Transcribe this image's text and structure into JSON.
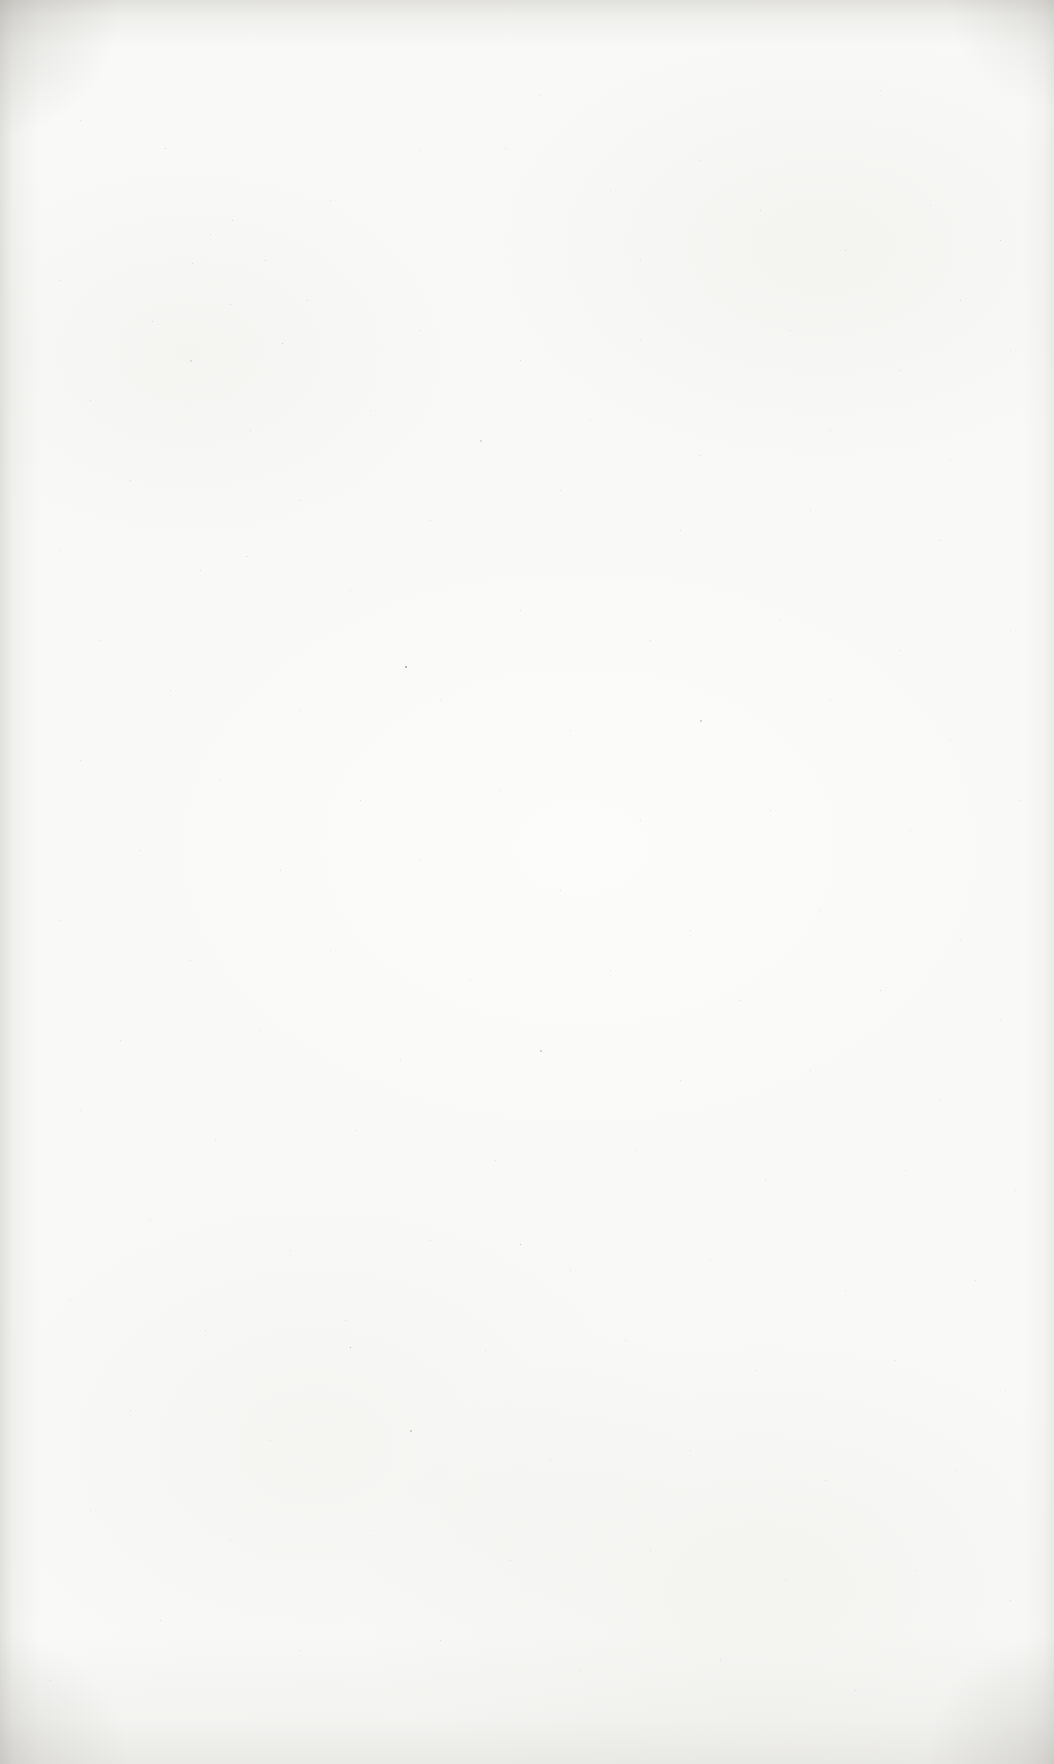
{
  "page": {
    "paper_color": "#f9f9f7",
    "edge_shadow_color": "#adaba4",
    "speck_color": "#55534e",
    "specks": [
      [
        165,
        148,
        1,
        0.3
      ],
      [
        232,
        220,
        1,
        0.25
      ],
      [
        210,
        234,
        1,
        0.22
      ],
      [
        265,
        260,
        1,
        0.28
      ],
      [
        192,
        263,
        1,
        0.2
      ],
      [
        330,
        200,
        1,
        0.18
      ],
      [
        420,
        150,
        1,
        0.2
      ],
      [
        505,
        148,
        1,
        0.25
      ],
      [
        610,
        190,
        1,
        0.18
      ],
      [
        700,
        160,
        1,
        0.2
      ],
      [
        760,
        210,
        1,
        0.22
      ],
      [
        845,
        250,
        1,
        0.25
      ],
      [
        930,
        205,
        1,
        0.2
      ],
      [
        1000,
        240,
        1,
        0.22
      ],
      [
        80,
        120,
        1,
        0.18
      ],
      [
        540,
        95,
        1,
        0.15
      ],
      [
        880,
        90,
        1,
        0.18
      ],
      [
        640,
        260,
        1,
        0.2
      ],
      [
        960,
        300,
        1,
        0.22
      ],
      [
        60,
        280,
        1,
        0.2
      ],
      [
        230,
        304,
        1,
        0.28
      ],
      [
        307,
        300,
        1,
        0.3
      ],
      [
        152,
        321,
        1,
        0.25
      ],
      [
        282,
        343,
        1,
        0.3
      ],
      [
        190,
        360,
        2,
        0.2
      ],
      [
        420,
        330,
        1,
        0.2
      ],
      [
        520,
        360,
        1,
        0.22
      ],
      [
        640,
        340,
        1,
        0.18
      ],
      [
        790,
        330,
        1,
        0.2
      ],
      [
        900,
        370,
        1,
        0.22
      ],
      [
        1010,
        350,
        1,
        0.18
      ],
      [
        90,
        400,
        1,
        0.2
      ],
      [
        250,
        430,
        1,
        0.22
      ],
      [
        370,
        410,
        1,
        0.18
      ],
      [
        480,
        440,
        2,
        0.25
      ],
      [
        590,
        420,
        1,
        0.2
      ],
      [
        700,
        455,
        1,
        0.22
      ],
      [
        830,
        430,
        1,
        0.2
      ],
      [
        950,
        460,
        1,
        0.18
      ],
      [
        130,
        480,
        1,
        0.2
      ],
      [
        300,
        500,
        1,
        0.25
      ],
      [
        430,
        520,
        1,
        0.2
      ],
      [
        560,
        490,
        1,
        0.18
      ],
      [
        680,
        530,
        1,
        0.22
      ],
      [
        810,
        510,
        1,
        0.2
      ],
      [
        940,
        540,
        1,
        0.25
      ],
      [
        60,
        550,
        1,
        0.18
      ],
      [
        200,
        570,
        1,
        0.2
      ],
      [
        350,
        590,
        1,
        0.22
      ],
      [
        246,
        556,
        1,
        0.3
      ],
      [
        405,
        666,
        2,
        0.55
      ],
      [
        520,
        610,
        1,
        0.2
      ],
      [
        650,
        640,
        1,
        0.22
      ],
      [
        780,
        620,
        1,
        0.18
      ],
      [
        900,
        650,
        1,
        0.2
      ],
      [
        1010,
        630,
        1,
        0.18
      ],
      [
        100,
        640,
        1,
        0.2
      ],
      [
        170,
        690,
        1,
        0.22
      ],
      [
        300,
        710,
        1,
        0.2
      ],
      [
        440,
        700,
        1,
        0.18
      ],
      [
        570,
        730,
        1,
        0.2
      ],
      [
        700,
        720,
        2,
        0.3
      ],
      [
        830,
        700,
        1,
        0.2
      ],
      [
        950,
        740,
        1,
        0.22
      ],
      [
        80,
        760,
        1,
        0.18
      ],
      [
        220,
        780,
        1,
        0.2
      ],
      [
        360,
        800,
        1,
        0.22
      ],
      [
        500,
        790,
        1,
        0.18
      ],
      [
        640,
        820,
        1,
        0.2
      ],
      [
        770,
        810,
        1,
        0.22
      ],
      [
        910,
        830,
        1,
        0.2
      ],
      [
        1020,
        800,
        1,
        0.18
      ],
      [
        140,
        850,
        1,
        0.2
      ],
      [
        280,
        870,
        1,
        0.22
      ],
      [
        420,
        860,
        1,
        0.18
      ],
      [
        560,
        890,
        1,
        0.2
      ],
      [
        690,
        930,
        1,
        0.22
      ],
      [
        820,
        910,
        1,
        0.2
      ],
      [
        960,
        940,
        1,
        0.18
      ],
      [
        60,
        920,
        1,
        0.2
      ],
      [
        190,
        960,
        1,
        0.22
      ],
      [
        330,
        950,
        1,
        0.18
      ],
      [
        470,
        980,
        1,
        0.2
      ],
      [
        610,
        970,
        1,
        0.22
      ],
      [
        740,
        1000,
        1,
        0.2
      ],
      [
        880,
        990,
        1,
        0.25
      ],
      [
        1000,
        1020,
        1,
        0.18
      ],
      [
        120,
        1040,
        1,
        0.2
      ],
      [
        260,
        1030,
        1,
        0.22
      ],
      [
        400,
        1060,
        1,
        0.18
      ],
      [
        540,
        1050,
        2,
        0.3
      ],
      [
        680,
        1080,
        1,
        0.2
      ],
      [
        810,
        1070,
        1,
        0.22
      ],
      [
        940,
        1100,
        1,
        0.2
      ],
      [
        80,
        1110,
        1,
        0.18
      ],
      [
        215,
        1140,
        1,
        0.2
      ],
      [
        355,
        1130,
        1,
        0.22
      ],
      [
        495,
        1160,
        1,
        0.18
      ],
      [
        635,
        1150,
        1,
        0.2
      ],
      [
        765,
        1180,
        1,
        0.22
      ],
      [
        905,
        1170,
        1,
        0.2
      ],
      [
        1015,
        1190,
        1,
        0.18
      ],
      [
        150,
        1220,
        1,
        0.2
      ],
      [
        290,
        1250,
        1,
        0.22
      ],
      [
        430,
        1240,
        1,
        0.18
      ],
      [
        570,
        1270,
        1,
        0.2
      ],
      [
        710,
        1260,
        1,
        0.22
      ],
      [
        845,
        1290,
        1,
        0.2
      ],
      [
        975,
        1280,
        1,
        0.18
      ],
      [
        70,
        1300,
        1,
        0.2
      ],
      [
        205,
        1330,
        1,
        0.22
      ],
      [
        345,
        1320,
        1,
        0.18
      ],
      [
        485,
        1350,
        1,
        0.2
      ],
      [
        625,
        1340,
        1,
        0.22
      ],
      [
        755,
        1370,
        1,
        0.2
      ],
      [
        895,
        1360,
        1,
        0.18
      ],
      [
        1005,
        1390,
        1,
        0.2
      ],
      [
        130,
        1410,
        1,
        0.22
      ],
      [
        270,
        1440,
        1,
        0.18
      ],
      [
        410,
        1430,
        2,
        0.3
      ],
      [
        550,
        1460,
        1,
        0.2
      ],
      [
        690,
        1450,
        1,
        0.22
      ],
      [
        825,
        1480,
        1,
        0.2
      ],
      [
        955,
        1470,
        1,
        0.18
      ],
      [
        90,
        1510,
        1,
        0.2
      ],
      [
        230,
        1540,
        1,
        0.22
      ],
      [
        370,
        1530,
        1,
        0.18
      ],
      [
        510,
        1560,
        1,
        0.2
      ],
      [
        650,
        1550,
        1,
        0.22
      ],
      [
        785,
        1580,
        1,
        0.2
      ],
      [
        915,
        1570,
        1,
        0.18
      ],
      [
        1010,
        1600,
        1,
        0.2
      ],
      [
        160,
        1620,
        1,
        0.22
      ],
      [
        300,
        1650,
        1,
        0.18
      ],
      [
        440,
        1640,
        1,
        0.2
      ],
      [
        580,
        1670,
        1,
        0.22
      ],
      [
        720,
        1660,
        1,
        0.2
      ],
      [
        855,
        1690,
        1,
        0.18
      ],
      [
        50,
        1680,
        1,
        0.2
      ],
      [
        350,
        1347,
        1,
        0.45
      ],
      [
        520,
        1244,
        1,
        0.4
      ]
    ]
  }
}
